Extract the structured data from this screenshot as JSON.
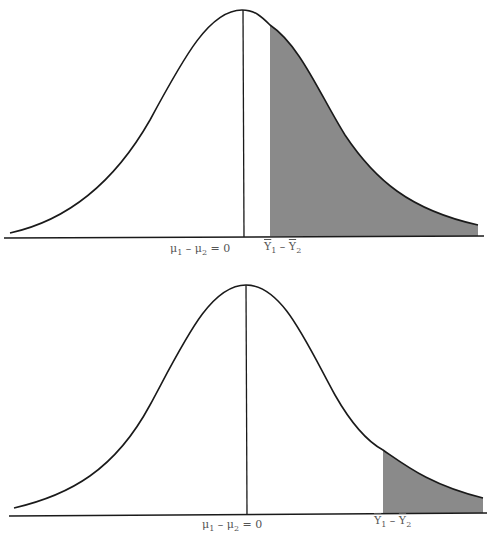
{
  "figure": {
    "panels": [
      {
        "id": "top",
        "mean_label": {
          "mu1": "μ",
          "sub1": "1",
          "minus": " – ",
          "mu2": "μ",
          "sub2": "2",
          "eq": " = 0"
        },
        "stat_label": {
          "y1": "Y",
          "sub1": "1",
          "minus": " – ",
          "y2": "Y",
          "sub2": "2"
        },
        "shaded_region": "right tail beyond observed difference (large)"
      },
      {
        "id": "bottom",
        "mean_label": {
          "mu1": "μ",
          "sub1": "1",
          "minus": " – ",
          "mu2": "μ",
          "sub2": "2",
          "eq": " = 0"
        },
        "stat_label": {
          "y1": "Y",
          "sub1": "1",
          "minus": " – ",
          "y2": "Y",
          "sub2": "2"
        },
        "shaded_region": "right tail beyond observed difference (small)"
      }
    ],
    "colors": {
      "curve": "#1a1a1a",
      "shade": "#8a8a8a",
      "axis": "#1a1a1a"
    }
  }
}
